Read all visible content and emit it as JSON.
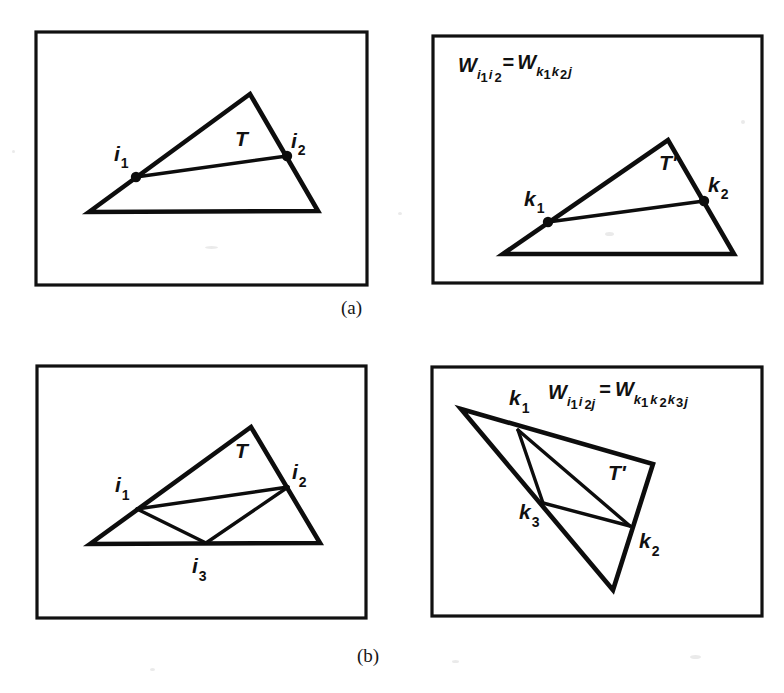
{
  "figure": {
    "background_color": "#ffffff",
    "ink_color": "#111111",
    "captions": [
      {
        "id": "a",
        "label": "(a)"
      },
      {
        "id": "b",
        "label": "(b)"
      }
    ]
  },
  "panels": [
    {
      "id": "panel-a-left",
      "position": "top-left",
      "rect": {
        "x": 36,
        "y": 32,
        "w": 331,
        "h": 253
      },
      "equation": null,
      "triangle_label": "T",
      "triangle_label_pos": {
        "x": 235,
        "y": 146
      },
      "outline": [
        {
          "x": 89,
          "y": 212
        },
        {
          "x": 250,
          "y": 94
        },
        {
          "x": 318,
          "y": 211
        }
      ],
      "inner_edges": [
        {
          "from": "i1",
          "to": "i2"
        }
      ],
      "vertices": [
        {
          "name": "i1",
          "base": "i",
          "sub": "1",
          "x": 136,
          "y": 177,
          "dot": true,
          "label_x": 114,
          "label_y": 161
        },
        {
          "name": "i2",
          "base": "i",
          "sub": "2",
          "x": 287,
          "y": 156,
          "dot": true,
          "label_x": 291,
          "label_y": 148
        }
      ]
    },
    {
      "id": "panel-a-right",
      "position": "top-right",
      "rect": {
        "x": 433,
        "y": 36,
        "w": 329,
        "h": 247
      },
      "equation": {
        "lhs_base": "W",
        "lhs_subs": [
          "i",
          "1",
          "i",
          "2"
        ],
        "operator": "=",
        "rhs_base": "W",
        "rhs_subs": [
          "k",
          "1",
          "k",
          "2",
          "j"
        ],
        "plain": "W i1 i2 = W k1 k2 j",
        "x": 458,
        "y": 72
      },
      "triangle_label": "T'",
      "triangle_label_pos": {
        "x": 659,
        "y": 170
      },
      "outline": [
        {
          "x": 503,
          "y": 254
        },
        {
          "x": 668,
          "y": 140
        },
        {
          "x": 734,
          "y": 254
        }
      ],
      "inner_edges": [
        {
          "from": "k1",
          "to": "k2"
        }
      ],
      "vertices": [
        {
          "name": "k1",
          "base": "k",
          "sub": "1",
          "x": 548,
          "y": 222,
          "dot": true,
          "label_x": 524,
          "label_y": 206
        },
        {
          "name": "k2",
          "base": "k",
          "sub": "2",
          "x": 704,
          "y": 201,
          "dot": true,
          "label_x": 708,
          "label_y": 192
        }
      ]
    },
    {
      "id": "panel-b-left",
      "position": "bottom-left",
      "rect": {
        "x": 37,
        "y": 366,
        "w": 329,
        "h": 252
      },
      "equation": null,
      "triangle_label": "T",
      "triangle_label_pos": {
        "x": 235,
        "y": 458
      },
      "outline": [
        {
          "x": 90,
          "y": 544
        },
        {
          "x": 251,
          "y": 427
        },
        {
          "x": 320,
          "y": 543
        }
      ],
      "inner_edges": [
        {
          "from": "i1",
          "to": "i2"
        },
        {
          "from": "i1",
          "to": "i3"
        },
        {
          "from": "i3",
          "to": "i2"
        }
      ],
      "vertices": [
        {
          "name": "i1",
          "base": "i",
          "sub": "1",
          "x": 137,
          "y": 509,
          "dot": false,
          "label_x": 115,
          "label_y": 492
        },
        {
          "name": "i2",
          "base": "i",
          "sub": "2",
          "x": 288,
          "y": 487,
          "dot": false,
          "label_x": 292,
          "label_y": 479
        },
        {
          "name": "i3",
          "base": "i",
          "sub": "3",
          "x": 206,
          "y": 543,
          "dot": false,
          "label_x": 192,
          "label_y": 573
        }
      ]
    },
    {
      "id": "panel-b-right",
      "position": "bottom-right",
      "rect": {
        "x": 432,
        "y": 367,
        "w": 330,
        "h": 249
      },
      "equation": {
        "lhs_base": "W",
        "lhs_subs": [
          "i",
          "1",
          "i",
          "2",
          "j"
        ],
        "operator": "=",
        "rhs_base": "W",
        "rhs_subs": [
          "k",
          "1",
          "k",
          "2",
          "k",
          "3",
          "j"
        ],
        "plain": "W i1 i2 j = W k1 k2 k3 j",
        "x": 548,
        "y": 399
      },
      "triangle_label": "T'",
      "triangle_label_pos": {
        "x": 608,
        "y": 480
      },
      "outline": [
        {
          "x": 461,
          "y": 409
        },
        {
          "x": 653,
          "y": 464
        },
        {
          "x": 613,
          "y": 590
        }
      ],
      "inner_edges": [
        {
          "from": "k1",
          "to": "k2"
        },
        {
          "from": "k1",
          "to": "k3"
        },
        {
          "from": "k3",
          "to": "k2"
        }
      ],
      "vertices": [
        {
          "name": "k1",
          "base": "k",
          "sub": "1",
          "x": 518,
          "y": 430,
          "dot": false,
          "label_x": 509,
          "label_y": 405
        },
        {
          "name": "k2",
          "base": "k",
          "sub": "2",
          "x": 630,
          "y": 526,
          "dot": false,
          "label_x": 639,
          "label_y": 548
        },
        {
          "name": "k3",
          "base": "k",
          "sub": "3",
          "x": 543,
          "y": 503,
          "dot": false,
          "label_x": 519,
          "label_y": 519
        }
      ]
    }
  ]
}
